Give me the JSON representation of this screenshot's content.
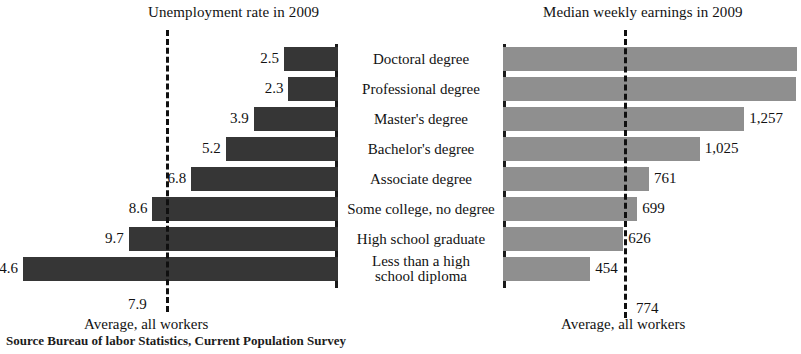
{
  "source_note": "Source Bureau of labor Statistics, Current Population Survey",
  "categories": [
    "Doctoral degree",
    "Professional degree",
    "Master's degree",
    "Bachelor's degree",
    "Associate degree",
    "Some college, no degree",
    "High school graduate",
    "Less than a high\nschool diploma"
  ],
  "left": {
    "title": "Unemployment rate in 2009",
    "average_value": "7.9",
    "average_caption": "Average, all workers"
  },
  "right": {
    "title": "Median weekly earnings in 2009",
    "average_value": "774",
    "average_caption": "Average, all workers"
  },
  "chart_data": [
    {
      "type": "bar",
      "id": "unemployment-rate-2009",
      "title": "Unemployment rate in 2009",
      "orientation": "horizontal-right-to-left",
      "xlabel": "",
      "ylabel": "",
      "categories": [
        "Doctoral degree",
        "Professional degree",
        "Master's degree",
        "Bachelor's degree",
        "Associate degree",
        "Some college, no degree",
        "High school graduate",
        "Less than a high school diploma"
      ],
      "values": [
        2.5,
        2.3,
        3.9,
        5.2,
        6.8,
        8.6,
        9.7,
        14.6
      ],
      "value_labels": [
        "2.5",
        "2.3",
        "3.9",
        "5.2",
        "6.8",
        "8.6",
        "9.7",
        "14.6"
      ],
      "xlim": [
        0,
        14.6
      ],
      "grid": false,
      "legend": "none",
      "bar_color": "#363636",
      "annotations": [
        {
          "type": "reference-line",
          "value": 7.9,
          "label": "7.9",
          "caption": "Average, all workers",
          "style": "dashed"
        }
      ]
    },
    {
      "type": "bar",
      "id": "median-weekly-earnings-2009",
      "title": "Median weekly earnings in 2009",
      "orientation": "horizontal-left-to-right",
      "xlabel": "",
      "ylabel": "",
      "categories": [
        "Doctoral degree",
        "Professional degree",
        "Master's degree",
        "Bachelor's degree",
        "Associate degree",
        "Some college, no degree",
        "High school graduate",
        "Less than a high school diploma"
      ],
      "values": [
        1532,
        1529,
        1257,
        1025,
        761,
        699,
        626,
        454
      ],
      "value_labels": [
        "$ 1,532",
        "1,529",
        "1,257",
        "1,025",
        "761",
        "699",
        "626",
        "454"
      ],
      "xlim": [
        0,
        1532
      ],
      "grid": false,
      "legend": "none",
      "bar_color": "#8f8f8f",
      "annotations": [
        {
          "type": "reference-line",
          "value": 774,
          "label": "774",
          "caption": "Average, all workers",
          "style": "dashed"
        }
      ]
    }
  ]
}
